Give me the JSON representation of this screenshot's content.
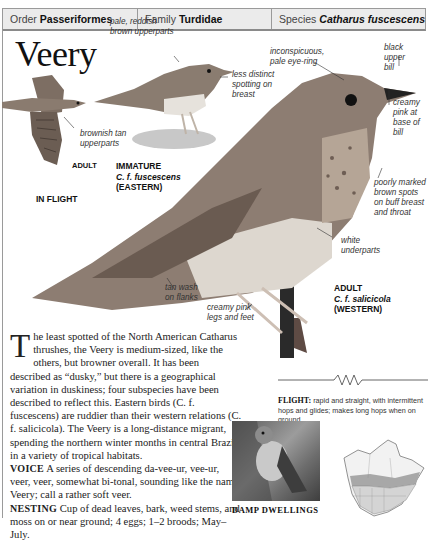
{
  "header": {
    "order_label": "Order",
    "order_value": "Passeriformes",
    "family_label": "Family",
    "family_value": "Turdidae",
    "species_label": "Species",
    "species_value": "Catharus fuscescens"
  },
  "title": "Veery",
  "annotations": {
    "immature_upperparts": [
      "pale, reddish",
      "brown upperparts"
    ],
    "immature_breast": [
      "less distinct",
      "spotting on",
      "breast"
    ],
    "flight_upperparts": [
      "brownish tan",
      "upperparts"
    ],
    "eye_ring": [
      "inconspicuous,",
      "pale eye-ring"
    ],
    "upper_bill": [
      "black upper",
      "bill"
    ],
    "bill_base": [
      "creamy",
      "pink at",
      "base of",
      "bill"
    ],
    "breast_spots": [
      "poorly marked",
      "brown spots",
      "on buff breast",
      "and throat"
    ],
    "underparts": [
      "white",
      "underparts"
    ],
    "flanks": [
      "tan wash",
      "on flanks"
    ],
    "legs": [
      "creamy pink",
      "legs and feet"
    ]
  },
  "captions": {
    "flight_adult": "ADULT",
    "in_flight": "IN FLIGHT",
    "immature_title": "IMMATURE",
    "immature_name": "C. f. fuscescens",
    "immature_region": "(EASTERN)",
    "adult_title": "ADULT",
    "adult_name": "C. f. salicicola",
    "adult_region": "(WESTERN)"
  },
  "description": {
    "dropcap": "T",
    "intro": "he least spotted of the North American Catharus thrushes, the Veery is medium-sized, like the others, but browner overall. It has been described as “dusky,” but there is a geographical variation in duskiness; four subspecies have been described to reflect this. Eastern birds (C. f. fuscescens) are ruddier than their western relations (C. f. salicicola). The Veery is a long-distance migrant, spending the northern winter months in central Brazil, in a variety of tropical habitats.",
    "voice_label": "VOICE",
    "voice_text": "A series of descending da-vee-ur, vee-ur, veer, veer, somewhat bi-tonal, sounding like the name Veery; call a rather soft veer.",
    "nesting_label": "NESTING",
    "nesting_text": "Cup of dead leaves, bark, weed stems, and moss on or near ground; 4 eggs; 1–2 broods; May–July."
  },
  "flight": {
    "label": "FLIGHT:",
    "text": "rapid and straight, with intermittent hops and glides; makes long hops when on ground."
  },
  "photo": {
    "caption": "DAMP DWELLINGS"
  },
  "map": {
    "icon": "range-map-north-america"
  }
}
